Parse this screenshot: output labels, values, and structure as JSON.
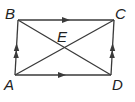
{
  "diagram": {
    "type": "parallelogram",
    "colors": {
      "stroke": "#3a3a3a",
      "label": "#222222",
      "background": "#ffffff"
    },
    "points": {
      "A": {
        "label": "A",
        "x": 15,
        "y": 75
      },
      "B": {
        "label": "B",
        "x": 18,
        "y": 20
      },
      "C": {
        "label": "C",
        "x": 114,
        "y": 20
      },
      "D": {
        "label": "D",
        "x": 111,
        "y": 75
      },
      "E": {
        "label": "E",
        "x": 64,
        "y": 47
      }
    },
    "sides": [
      {
        "name": "AB",
        "marks": "double-arrow"
      },
      {
        "name": "BC",
        "marks": "single-arrow"
      },
      {
        "name": "DC",
        "marks": "double-arrow"
      },
      {
        "name": "AD",
        "marks": "single-arrow"
      }
    ],
    "diagonals": [
      "AC",
      "BD"
    ]
  }
}
